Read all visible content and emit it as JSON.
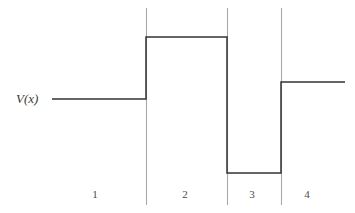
{
  "figure": {
    "title": "",
    "axis_label": "V(x)",
    "stroke_color": "#333333",
    "boundary_color": "#a8a8a8",
    "background": "#ffffff",
    "width": 355,
    "height": 213
  },
  "chart_data": {
    "type": "line",
    "title": "",
    "xlabel": "",
    "ylabel": "V(x)",
    "grid": false,
    "legend": null,
    "xlim": [
      52,
      345
    ],
    "ylim_pixels": [
      37,
      173
    ],
    "region_boundaries_px": [
      146,
      227,
      281
    ],
    "regions": [
      {
        "label": "1",
        "x_start_px": 52,
        "x_end_px": 146,
        "level_px": 99,
        "level_rel": 0.0,
        "center_px": 95
      },
      {
        "label": "2",
        "x_start_px": 146,
        "x_end_px": 227,
        "level_px": 37,
        "level_rel": 1.0,
        "center_px": 185
      },
      {
        "label": "3",
        "x_start_px": 227,
        "x_end_px": 281,
        "level_px": 173,
        "level_rel": -1.19,
        "center_px": 252
      },
      {
        "label": "4",
        "x_start_px": 281,
        "x_end_px": 345,
        "level_px": 82,
        "level_rel": 0.27,
        "center_px": 307
      }
    ],
    "series": [
      {
        "name": "V(x)",
        "x": [
          52,
          146,
          146,
          227,
          227,
          281,
          281,
          345
        ],
        "y": [
          99,
          99,
          37,
          37,
          173,
          173,
          82,
          82
        ]
      }
    ],
    "region_labels": [
      "1",
      "2",
      "3",
      "4"
    ],
    "region_label_y_px": 195
  }
}
